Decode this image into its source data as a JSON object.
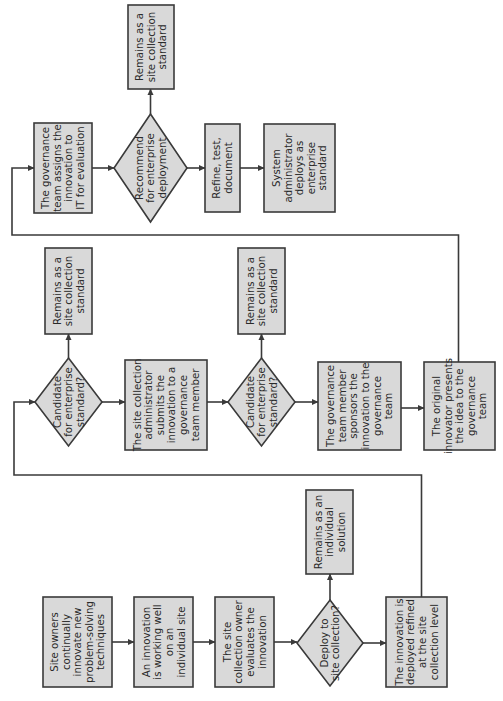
{
  "diagram": {
    "type": "flowchart",
    "orientation": "rotated-90-ccw",
    "colors": {
      "node_fill": "#d9d9d9",
      "node_stroke": "#3a3a3a",
      "text": "#2a2a2a",
      "background": "#ffffff"
    },
    "nodes": [
      {
        "id": "n1",
        "shape": "process",
        "lines": [
          "Site owners",
          "continually",
          "innovate new",
          "problem-solving",
          "techniques"
        ]
      },
      {
        "id": "n2",
        "shape": "process",
        "lines": [
          "An innovation",
          "is working well",
          "on an",
          "individual site"
        ]
      },
      {
        "id": "n3",
        "shape": "process",
        "lines": [
          "The site",
          "collection owner",
          "evaluates the",
          "innovation"
        ]
      },
      {
        "id": "n4",
        "shape": "decision",
        "lines": [
          "Deploy to",
          "site collection?"
        ]
      },
      {
        "id": "n5",
        "shape": "process",
        "lines": [
          "Remains as an",
          "individual",
          "solution"
        ]
      },
      {
        "id": "n6",
        "shape": "process",
        "lines": [
          "The innovation is",
          "deployed refined",
          "at the site",
          "collection level"
        ]
      },
      {
        "id": "n7",
        "shape": "decision",
        "lines": [
          "Candidate",
          "for enterprise",
          "standard?"
        ]
      },
      {
        "id": "n8",
        "shape": "process",
        "lines": [
          "Remains as a",
          "site collection",
          "standard"
        ]
      },
      {
        "id": "n9",
        "shape": "process",
        "lines": [
          "The site collection",
          "administrator",
          "submits the",
          "innovation to a",
          "governance",
          "team member"
        ]
      },
      {
        "id": "n10",
        "shape": "decision",
        "lines": [
          "Candidate",
          "for enterprise",
          "standard?"
        ]
      },
      {
        "id": "n11",
        "shape": "process",
        "lines": [
          "Remains as a",
          "site collection",
          "standard"
        ]
      },
      {
        "id": "n12",
        "shape": "process",
        "lines": [
          "The governance",
          "team member",
          "sponsors the",
          "innovation to the",
          "governance",
          "team"
        ]
      },
      {
        "id": "n13",
        "shape": "process",
        "lines": [
          "The original",
          "innovator presents",
          "the idea to the",
          "governance",
          "team"
        ]
      },
      {
        "id": "n14",
        "shape": "process",
        "lines": [
          "The governance",
          "team assigns the",
          "innovation to",
          "IT for evaluation"
        ]
      },
      {
        "id": "n15",
        "shape": "decision",
        "lines": [
          "Recommend",
          "for enterprise",
          "deployment"
        ]
      },
      {
        "id": "n16",
        "shape": "process",
        "lines": [
          "Remains as a",
          "site collection",
          "standard"
        ]
      },
      {
        "id": "n17",
        "shape": "process",
        "lines": [
          "Refine, test,",
          "document"
        ]
      },
      {
        "id": "n18",
        "shape": "process",
        "lines": [
          "System",
          "administrator",
          "deploys as",
          "enterprise",
          "standard"
        ]
      }
    ],
    "edges": [
      {
        "from": "n1",
        "to": "n2"
      },
      {
        "from": "n2",
        "to": "n3"
      },
      {
        "from": "n3",
        "to": "n4"
      },
      {
        "from": "n4",
        "to": "n5"
      },
      {
        "from": "n4",
        "to": "n6"
      },
      {
        "from": "n6",
        "to": "n7"
      },
      {
        "from": "n7",
        "to": "n8"
      },
      {
        "from": "n7",
        "to": "n9"
      },
      {
        "from": "n9",
        "to": "n10"
      },
      {
        "from": "n10",
        "to": "n11"
      },
      {
        "from": "n10",
        "to": "n12"
      },
      {
        "from": "n12",
        "to": "n13"
      },
      {
        "from": "n13",
        "to": "n14"
      },
      {
        "from": "n14",
        "to": "n15"
      },
      {
        "from": "n15",
        "to": "n16"
      },
      {
        "from": "n15",
        "to": "n17"
      },
      {
        "from": "n17",
        "to": "n18"
      }
    ]
  }
}
